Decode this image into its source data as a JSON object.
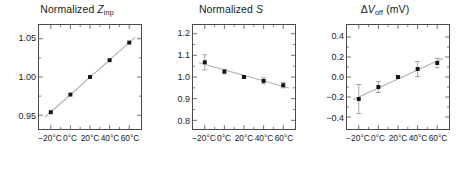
{
  "figure": {
    "panel_count": 3,
    "marker_color": "#141414",
    "line_color": "#b0b0b0",
    "axis_color": "#4a4a4a",
    "background": "#ffffff"
  },
  "chart_data": [
    {
      "type": "scatter",
      "title": "Normalized Zinp",
      "title_prefix": "Normalized ",
      "title_symbol": "Z",
      "title_subscript": "inp",
      "title_suffix": "",
      "xlabel": "",
      "ylabel": "",
      "x": [
        -20,
        0,
        20,
        40,
        60
      ],
      "xtick_labels": [
        "−20°C",
        "0°C",
        "20°C",
        "40°C",
        "60°C"
      ],
      "values": [
        0.954,
        0.977,
        1.0,
        1.022,
        1.045
      ],
      "errors": [
        0,
        0,
        0,
        0,
        0
      ],
      "ytick_labels": [
        "1.05",
        "1.00",
        "0.95"
      ],
      "yticks": [
        1.05,
        1.0,
        0.95
      ],
      "ylim": [
        0.932,
        1.068
      ],
      "xlim": [
        -32,
        72
      ],
      "grid": false,
      "has_fit_line": true,
      "has_error_bars": false,
      "legend": null
    },
    {
      "type": "scatter",
      "title": "Normalized S",
      "title_prefix": "Normalized ",
      "title_symbol": "S",
      "title_subscript": "",
      "title_suffix": "",
      "xlabel": "",
      "ylabel": "",
      "x": [
        -20,
        0,
        20,
        40,
        60
      ],
      "xtick_labels": [
        "−20°C",
        "0°C",
        "20°C",
        "40°C",
        "60°C"
      ],
      "values": [
        1.068,
        1.025,
        1.0,
        0.982,
        0.962
      ],
      "errors": [
        0.035,
        0.01,
        0.006,
        0.014,
        0.012
      ],
      "ytick_labels": [
        "1.2",
        "1.1",
        "1.0",
        "0.9",
        "0.8"
      ],
      "yticks": [
        1.2,
        1.1,
        1.0,
        0.9,
        0.8
      ],
      "ylim": [
        0.76,
        1.24
      ],
      "xlim": [
        -32,
        72
      ],
      "grid": false,
      "has_fit_line": true,
      "has_error_bars": true,
      "legend": null
    },
    {
      "type": "scatter",
      "title": "ΔVoff (mV)",
      "title_prefix": "Δ",
      "title_symbol": "V",
      "title_subscript": "off",
      "title_suffix": " (mV)",
      "xlabel": "",
      "ylabel": "",
      "x": [
        -20,
        0,
        20,
        40,
        60
      ],
      "xtick_labels": [
        "−20°C",
        "0°C",
        "20°C",
        "40°C",
        "60°C"
      ],
      "values": [
        -0.22,
        -0.1,
        0.0,
        0.08,
        0.14
      ],
      "errors": [
        0.145,
        0.055,
        0.012,
        0.075,
        0.048
      ],
      "ytick_labels": [
        "0.4",
        "0.2",
        "0.0",
        "−0.2",
        "−0.4"
      ],
      "yticks": [
        0.4,
        0.2,
        0.0,
        -0.2,
        -0.4
      ],
      "ylim": [
        -0.52,
        0.52
      ],
      "xlim": [
        -32,
        72
      ],
      "grid": false,
      "has_fit_line": true,
      "has_error_bars": true,
      "legend": null
    }
  ]
}
